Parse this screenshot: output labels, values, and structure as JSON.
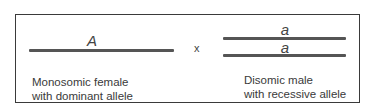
{
  "female": {
    "allele": "A",
    "label_line1": "Monosomic female",
    "label_line2": "with dominant allele"
  },
  "cross_symbol": "x",
  "male": {
    "allele_top": "a",
    "allele_bottom": "a",
    "label_line1": "Disomic male",
    "label_line2": "with recessive allele"
  }
}
